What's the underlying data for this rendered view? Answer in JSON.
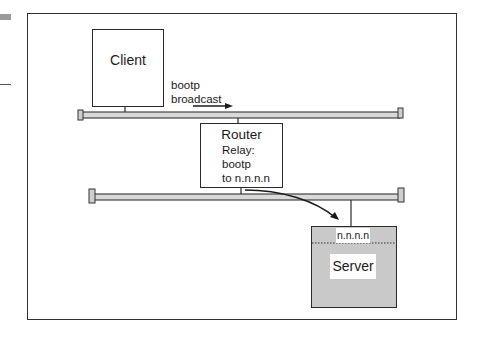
{
  "diagram": {
    "title": "",
    "nodes": {
      "client": {
        "label": "Client"
      },
      "router": {
        "label": "Router",
        "detail_lines": [
          "Relay:",
          "bootp",
          "to n.n.n.n"
        ]
      },
      "server": {
        "label": "Server",
        "address": "n.n.n.n"
      }
    },
    "annotations": {
      "broadcast_lines": [
        "bootp",
        "broadcast"
      ]
    },
    "networks": [
      {
        "name": "client-segment"
      },
      {
        "name": "server-segment"
      }
    ],
    "edges": [
      {
        "from": "client",
        "to": "client-segment",
        "type": "link"
      },
      {
        "from": "client-segment",
        "to": "router",
        "type": "link"
      },
      {
        "from": "router",
        "to": "server-segment",
        "type": "link"
      },
      {
        "from": "server-segment",
        "to": "server",
        "type": "link"
      },
      {
        "from": "client",
        "to": "router",
        "type": "arrow",
        "label": "bootp broadcast"
      },
      {
        "from": "router",
        "to": "server",
        "type": "curved-arrow",
        "label": "relay to n.n.n.n"
      }
    ],
    "colors": {
      "bus_fill": "#d9d9d9",
      "server_fill": "#c9c9c9",
      "stroke": "#2a2a2a"
    }
  }
}
